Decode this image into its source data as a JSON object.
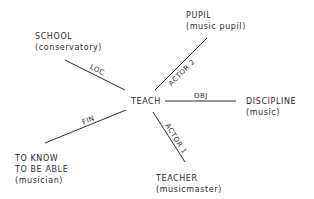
{
  "diagram": {
    "center": {
      "label": "TEACH"
    },
    "nodes": [
      {
        "id": "school",
        "label": "SCHOOL",
        "sub": "(conservatory)",
        "relation": "LOC"
      },
      {
        "id": "pupil",
        "label": "PUPIL",
        "sub": "(music pupil)",
        "relation": "ACTOR 2"
      },
      {
        "id": "discipline",
        "label": "DISCIPLINE",
        "sub": "(music)",
        "relation": "OBJ"
      },
      {
        "id": "teacher",
        "label": "TEACHER",
        "sub": "(musicmaster)",
        "relation": "ACTOR 1"
      },
      {
        "id": "goal",
        "label_lines": [
          "TO KNOW",
          "TO BE ABLE"
        ],
        "sub": "(musician)",
        "relation": "FIN"
      }
    ],
    "edge_labels": {
      "loc": "LOC",
      "actor2": "ACTOR 2",
      "obj": "OBJ",
      "actor1": "ACTOR 1",
      "fin": "FIN"
    },
    "colors": {
      "ink": "#2a2a2a",
      "background": "#ffffff"
    }
  }
}
